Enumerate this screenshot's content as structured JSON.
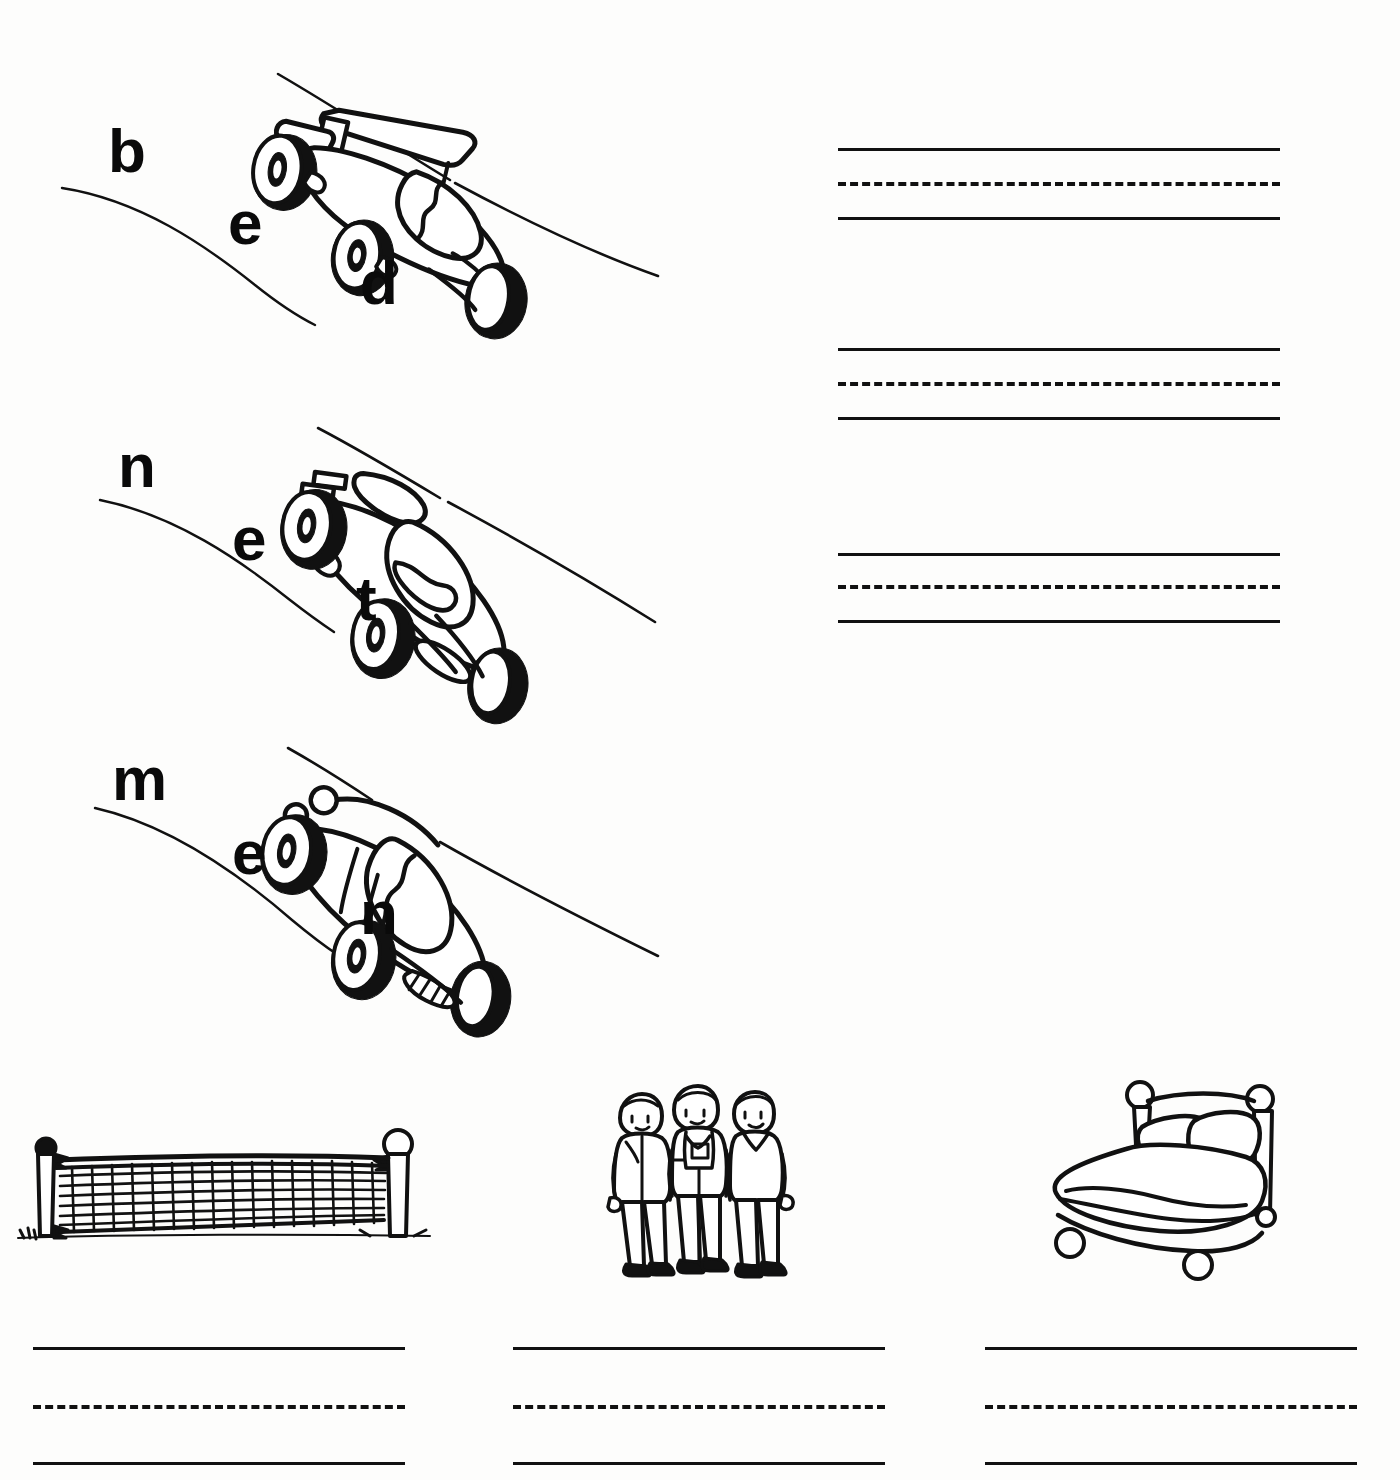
{
  "worksheet": {
    "title": "Short e word building worksheet",
    "background_color": "#fdfdfc",
    "ink_color": "#111111"
  },
  "word_building_rows": [
    {
      "word": "bed",
      "letters": [
        {
          "char": "b",
          "x": 108,
          "y": 120
        },
        {
          "char": "e",
          "x": 228,
          "y": 192
        },
        {
          "char": "d",
          "x": 360,
          "y": 252
        }
      ],
      "picture": "race-car-with-rear-wing",
      "track_label": "race-track-curve"
    },
    {
      "word": "net",
      "letters": [
        {
          "char": "n",
          "x": 118,
          "y": 435
        },
        {
          "char": "e",
          "x": 232,
          "y": 508
        },
        {
          "char": "t",
          "x": 356,
          "y": 568
        }
      ],
      "picture": "race-car-rounded-cockpit",
      "track_label": "race-track-curve"
    },
    {
      "word": "men",
      "letters": [
        {
          "char": "m",
          "x": 112,
          "y": 748
        },
        {
          "char": "e",
          "x": 232,
          "y": 822
        },
        {
          "char": "n",
          "x": 360,
          "y": 882
        }
      ],
      "picture": "race-car-with-grille",
      "track_label": "race-track-curve"
    }
  ],
  "writing_line_groups_right": [
    {
      "for_word": "bed",
      "left": 838,
      "top": 148,
      "width": 442,
      "solid_top_y": 0,
      "dashed_y": 34,
      "solid_bottom_y": 69
    },
    {
      "for_word": "net",
      "left": 838,
      "top": 348,
      "width": 442,
      "solid_top_y": 0,
      "dashed_y": 34,
      "solid_bottom_y": 69
    },
    {
      "for_word": "men",
      "left": 838,
      "top": 553,
      "width": 442,
      "solid_top_y": 0,
      "dashed_y": 32,
      "solid_bottom_y": 67
    }
  ],
  "picture_cells_bottom": [
    {
      "picture": "volleyball-net",
      "answer_word": "net",
      "pic_left": 10,
      "pic_top": 1110,
      "pic_width": 430,
      "pic_height": 160,
      "lines_left": 33,
      "lines_top": 1347,
      "lines_width": 372
    },
    {
      "picture": "three-men-standing",
      "answer_word": "men",
      "pic_left": 592,
      "pic_top": 1080,
      "pic_width": 210,
      "pic_height": 200,
      "lines_left": 513,
      "lines_top": 1347,
      "lines_width": 372
    },
    {
      "picture": "bed-with-pillows",
      "answer_word": "bed",
      "pic_left": 1030,
      "pic_top": 1075,
      "pic_width": 270,
      "pic_height": 210,
      "lines_left": 985,
      "lines_top": 1347,
      "lines_width": 372
    }
  ],
  "line_geometry": {
    "dashed_offset": 58,
    "bottom_solid_offset": 115
  }
}
